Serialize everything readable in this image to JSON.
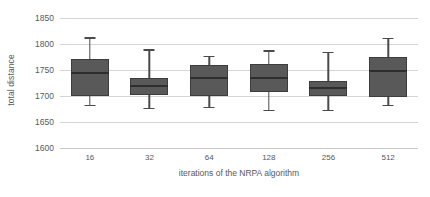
{
  "chart_data": {
    "type": "box",
    "title": "",
    "xlabel": "iterations of the NRPA algorithm",
    "ylabel": "total distance",
    "categories": [
      "16",
      "32",
      "64",
      "128",
      "256",
      "512"
    ],
    "ylim": [
      1600,
      1850
    ],
    "yticks": [
      1850,
      1800,
      1750,
      1700,
      1650,
      1600
    ],
    "ytick_labels": [
      "1850",
      "1800",
      "1750",
      "1700",
      "1650",
      "1600"
    ],
    "grid": true,
    "legend": "none",
    "box_color": "#595959",
    "median_color": "#2e2e2e",
    "whisker_color": "#4a4a4a",
    "gridline_color": "#d4d4d4",
    "text_color": "#58585a",
    "background": "#ffffff",
    "boxes": [
      {
        "category": "16",
        "whisker_low": 1683,
        "q1": 1700,
        "median": 1744,
        "q3": 1772,
        "whisker_high": 1813
      },
      {
        "category": "32",
        "whisker_low": 1677,
        "q1": 1702,
        "median": 1719,
        "q3": 1735,
        "whisker_high": 1790
      },
      {
        "category": "64",
        "whisker_low": 1679,
        "q1": 1700,
        "median": 1735,
        "q3": 1760,
        "whisker_high": 1777
      },
      {
        "category": "128",
        "whisker_low": 1673,
        "q1": 1708,
        "median": 1735,
        "q3": 1762,
        "whisker_high": 1788
      },
      {
        "category": "256",
        "whisker_low": 1673,
        "q1": 1700,
        "median": 1715,
        "q3": 1729,
        "whisker_high": 1785
      },
      {
        "category": "512",
        "whisker_low": 1683,
        "q1": 1698,
        "median": 1748,
        "q3": 1775,
        "whisker_high": 1812
      }
    ]
  }
}
